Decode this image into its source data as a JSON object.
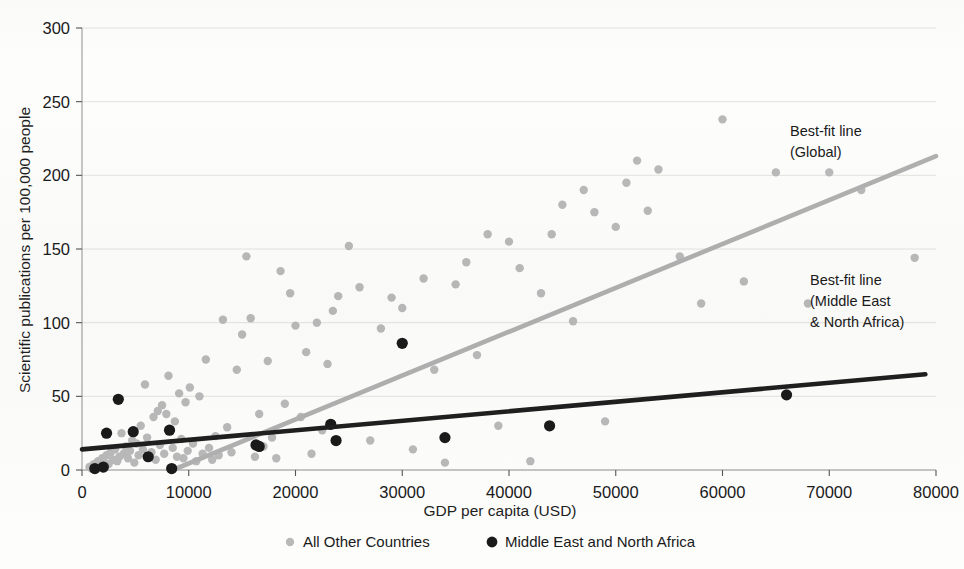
{
  "chart_data": {
    "type": "scatter",
    "title": "",
    "xlabel": "GDP per capita (USD)",
    "ylabel": "Scientific publications per 100,000 people",
    "xlim": [
      0,
      80000
    ],
    "ylim": [
      0,
      300
    ],
    "xticks": [
      0,
      10000,
      20000,
      30000,
      40000,
      50000,
      60000,
      70000,
      80000
    ],
    "xtick_labels": [
      "0",
      "10000",
      "20000",
      "30000",
      "40000",
      "50000",
      "60000",
      "70000",
      "80000"
    ],
    "yticks": [
      0,
      50,
      100,
      150,
      200,
      250,
      300
    ],
    "ytick_labels": [
      "0",
      "50",
      "100",
      "150",
      "200",
      "250",
      "300"
    ],
    "grid": "horizontal",
    "legend_position": "bottom",
    "series": [
      {
        "name": "All Other Countries",
        "marker": "circle",
        "color": "#b9b9b9",
        "points": [
          [
            700,
            2
          ],
          [
            900,
            1
          ],
          [
            1100,
            4
          ],
          [
            1300,
            2
          ],
          [
            1500,
            6
          ],
          [
            1700,
            3
          ],
          [
            1900,
            8
          ],
          [
            2100,
            5
          ],
          [
            2300,
            10
          ],
          [
            2500,
            4
          ],
          [
            2700,
            12
          ],
          [
            2900,
            7
          ],
          [
            3100,
            14
          ],
          [
            3300,
            6
          ],
          [
            3500,
            9
          ],
          [
            3700,
            25
          ],
          [
            3900,
            11
          ],
          [
            4100,
            16
          ],
          [
            4300,
            8
          ],
          [
            4500,
            13
          ],
          [
            4700,
            20
          ],
          [
            4900,
            5
          ],
          [
            5100,
            18
          ],
          [
            5300,
            10
          ],
          [
            5500,
            30
          ],
          [
            5700,
            14
          ],
          [
            5900,
            58
          ],
          [
            6100,
            22
          ],
          [
            6300,
            9
          ],
          [
            6500,
            12
          ],
          [
            6700,
            36
          ],
          [
            6900,
            7
          ],
          [
            7100,
            40
          ],
          [
            7300,
            17
          ],
          [
            7500,
            44
          ],
          [
            7700,
            11
          ],
          [
            7900,
            38
          ],
          [
            8100,
            64
          ],
          [
            8300,
            27
          ],
          [
            8500,
            15
          ],
          [
            8700,
            33
          ],
          [
            8900,
            9
          ],
          [
            9100,
            52
          ],
          [
            9300,
            21
          ],
          [
            9500,
            8
          ],
          [
            9700,
            46
          ],
          [
            9900,
            13
          ],
          [
            10100,
            56
          ],
          [
            10400,
            18
          ],
          [
            10700,
            6
          ],
          [
            11000,
            50
          ],
          [
            11300,
            11
          ],
          [
            11600,
            75
          ],
          [
            11900,
            15
          ],
          [
            12200,
            7
          ],
          [
            12500,
            23
          ],
          [
            12800,
            10
          ],
          [
            13200,
            102
          ],
          [
            13600,
            29
          ],
          [
            14000,
            12
          ],
          [
            14500,
            68
          ],
          [
            15000,
            92
          ],
          [
            15400,
            145
          ],
          [
            15800,
            103
          ],
          [
            16200,
            9
          ],
          [
            16600,
            38
          ],
          [
            17000,
            16
          ],
          [
            17400,
            74
          ],
          [
            17800,
            22
          ],
          [
            18200,
            8
          ],
          [
            18600,
            135
          ],
          [
            19000,
            45
          ],
          [
            19500,
            120
          ],
          [
            20000,
            98
          ],
          [
            20500,
            36
          ],
          [
            21000,
            80
          ],
          [
            21500,
            11
          ],
          [
            22000,
            100
          ],
          [
            22500,
            27
          ],
          [
            23000,
            72
          ],
          [
            23500,
            108
          ],
          [
            24000,
            118
          ],
          [
            25000,
            152
          ],
          [
            26000,
            124
          ],
          [
            27000,
            20
          ],
          [
            28000,
            96
          ],
          [
            29000,
            117
          ],
          [
            30000,
            110
          ],
          [
            31000,
            14
          ],
          [
            32000,
            130
          ],
          [
            33000,
            68
          ],
          [
            34000,
            5
          ],
          [
            35000,
            126
          ],
          [
            36000,
            141
          ],
          [
            37000,
            78
          ],
          [
            38000,
            160
          ],
          [
            39000,
            30
          ],
          [
            40000,
            155
          ],
          [
            41000,
            137
          ],
          [
            42000,
            6
          ],
          [
            43000,
            120
          ],
          [
            44000,
            160
          ],
          [
            45000,
            180
          ],
          [
            46000,
            101
          ],
          [
            47000,
            190
          ],
          [
            48000,
            175
          ],
          [
            49000,
            33
          ],
          [
            50000,
            165
          ],
          [
            51000,
            195
          ],
          [
            52000,
            210
          ],
          [
            53000,
            176
          ],
          [
            54000,
            204
          ],
          [
            56000,
            145
          ],
          [
            58000,
            113
          ],
          [
            60000,
            238
          ],
          [
            62000,
            128
          ],
          [
            65000,
            202
          ],
          [
            68000,
            113
          ],
          [
            70000,
            202
          ],
          [
            73000,
            190
          ],
          [
            78000,
            144
          ]
        ]
      },
      {
        "name": "Middle East and North Africa",
        "marker": "circle",
        "color": "#1a1a1a",
        "points": [
          [
            1200,
            1
          ],
          [
            2000,
            2
          ],
          [
            2300,
            25
          ],
          [
            3400,
            48
          ],
          [
            4800,
            26
          ],
          [
            6200,
            9
          ],
          [
            8200,
            27
          ],
          [
            8400,
            1
          ],
          [
            16300,
            17
          ],
          [
            16600,
            16
          ],
          [
            23300,
            31
          ],
          [
            23800,
            20
          ],
          [
            30000,
            86
          ],
          [
            34000,
            22
          ],
          [
            43800,
            30
          ],
          [
            66000,
            51
          ]
        ]
      }
    ],
    "trendlines": [
      {
        "name": "Best-fit line (Global)",
        "color": "#b0b0b0",
        "x0": 8500,
        "y0": 0,
        "x1": 80000,
        "y1": 213
      },
      {
        "name": "Best-fit line (Middle East & North Africa)",
        "color": "#1f1f1f",
        "x0": 0,
        "y0": 14,
        "x1": 79000,
        "y1": 65
      }
    ],
    "annotations": [
      {
        "id": "global-annot",
        "lines": [
          "Best-fit line",
          "(Global)"
        ],
        "x": 790,
        "y": 136
      },
      {
        "id": "mena-annot",
        "lines": [
          "Best-fit line",
          "(Middle East",
          "& North Africa)"
        ],
        "x": 810,
        "y": 285
      }
    ]
  },
  "legend": {
    "items": [
      {
        "label": "All Other Countries",
        "color": "#b9b9b9"
      },
      {
        "label": "Middle East and North Africa",
        "color": "#1a1a1a"
      }
    ]
  }
}
